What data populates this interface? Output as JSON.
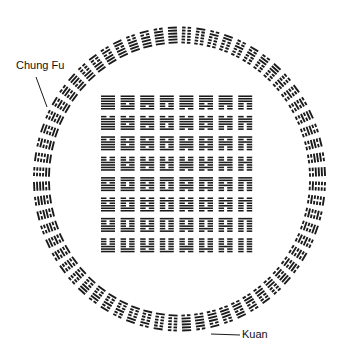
{
  "colors": {
    "line": "#1a1a1a",
    "background": "#ffffff"
  },
  "labels": {
    "chung_fu": "Chung Fu",
    "kuan": "Kuan"
  },
  "circle": {
    "center": [
      179.5,
      179
    ],
    "radius_x": 147,
    "radius_y": 153,
    "band_width": 18,
    "count": 64,
    "arrangement": "Fu Xi circular (binary sequence)"
  },
  "square": {
    "origin": [
      101,
      95
    ],
    "rows": 8,
    "cols": 8,
    "pitch_x": 19.6,
    "pitch_y": 20.4,
    "cell_w": 14,
    "cell_h": 15,
    "arrangement": "Fu Xi square (binary sequence), Qian top-left, Kun bottom-right"
  },
  "annotations": [
    {
      "name": "chung-fu-pointer",
      "from": [
        36,
        77
      ],
      "to": [
        47,
        107
      ]
    },
    {
      "name": "kuan-pointer",
      "from": [
        211,
        334
      ],
      "to": [
        240,
        335
      ]
    }
  ]
}
